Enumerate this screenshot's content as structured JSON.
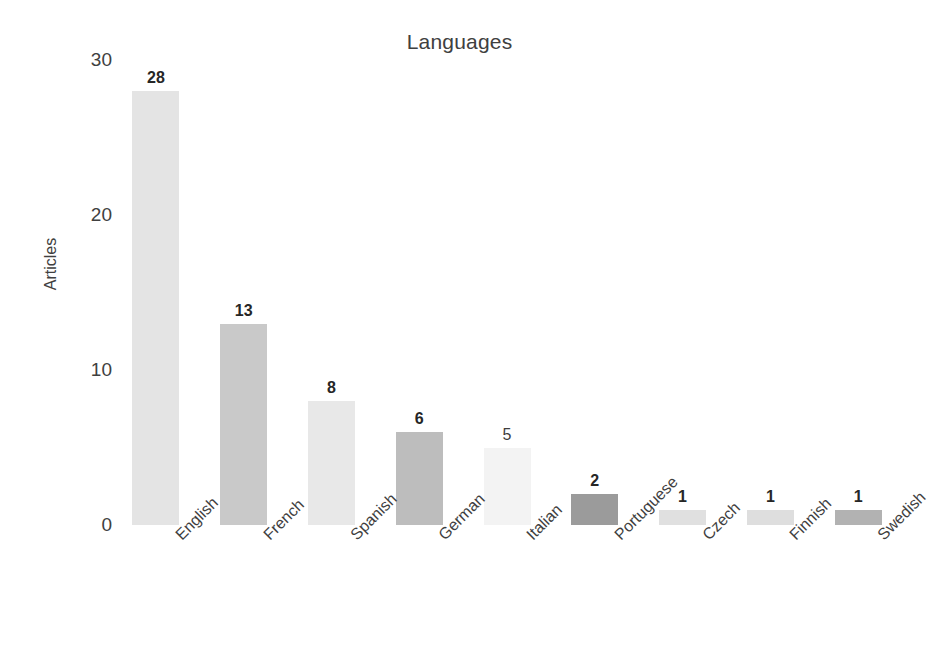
{
  "chart_data": {
    "type": "bar",
    "title": "Languages",
    "xlabel": "",
    "ylabel": "Articles",
    "categories": [
      "English",
      "French",
      "Spanish",
      "German",
      "Italian",
      "Portuguese",
      "Czech",
      "Finnish",
      "Swedish"
    ],
    "values": [
      28,
      13,
      8,
      6,
      5,
      2,
      1,
      1,
      1
    ],
    "value_labels": [
      "28",
      "13",
      "8",
      "6",
      "5",
      "2",
      "1",
      "1",
      "1"
    ],
    "ylim": [
      0,
      30
    ],
    "yticks": [
      0,
      10,
      20,
      30
    ],
    "ytick_labels": [
      "0",
      "10",
      "20",
      "30"
    ],
    "grid": false,
    "legend": false,
    "bar_colors": [
      "#e4e4e4",
      "#c9c9c9",
      "#e8e8e8",
      "#bdbdbd",
      "#f3f3f3",
      "#9b9b9b",
      "#e0e0e0",
      "#dedede",
      "#b2b2b2"
    ],
    "label_rotation": -45
  },
  "style": {
    "background": "#ffffff",
    "text_color": "#404040",
    "value_label_color": "#262626"
  }
}
